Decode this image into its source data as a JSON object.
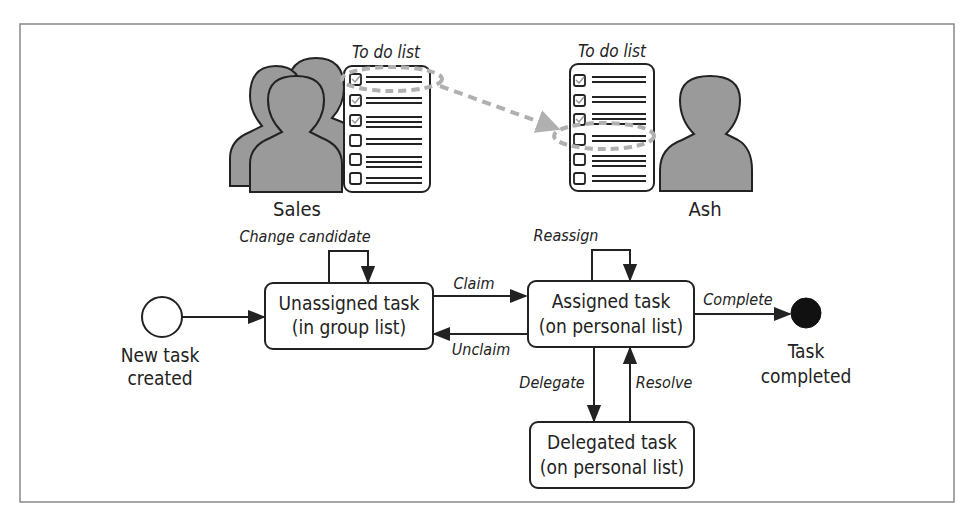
{
  "diagram": {
    "type": "state-machine",
    "illustration": {
      "group_owner": "Sales",
      "user_owner": "Ash",
      "group_list_label": "To do list",
      "user_list_label": "To do list"
    },
    "states": {
      "start": {
        "label_line1": "New task",
        "label_line2": "created"
      },
      "unassigned": {
        "line1": "Unassigned task",
        "line2": "(in group list)"
      },
      "assigned": {
        "line1": "Assigned task",
        "line2": "(on personal list)"
      },
      "delegated": {
        "line1": "Delegated task",
        "line2": "(on personal list)"
      },
      "end": {
        "label_line1": "Task",
        "label_line2": "completed"
      }
    },
    "transitions": {
      "change_candidate": "Change candidate",
      "claim": "Claim",
      "unclaim": "Unclaim",
      "reassign": "Reassign",
      "complete": "Complete",
      "delegate": "Delegate",
      "resolve": "Resolve"
    },
    "colors": {
      "stroke": "#222222",
      "person_fill": "#9a9a9a",
      "dashed_arrow": "#b0b0b0",
      "frame": "#888888",
      "end_fill": "#111111"
    }
  }
}
